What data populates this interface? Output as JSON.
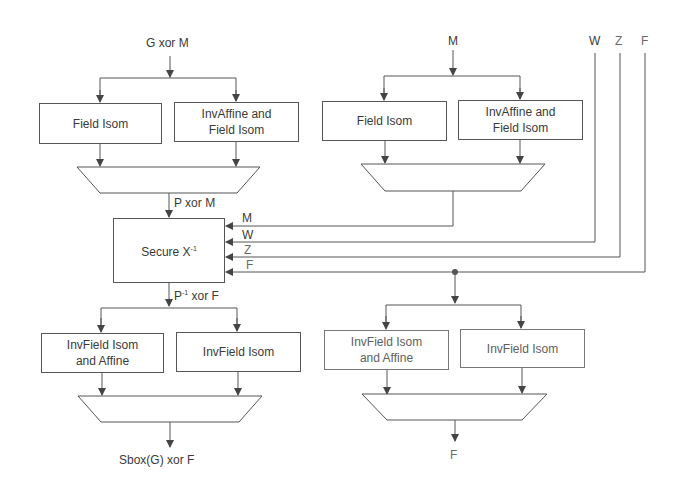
{
  "diagram": {
    "title": "",
    "left_path": {
      "input_label": "G xor M",
      "top_boxes": [
        {
          "label_lines": [
            "Field Isom"
          ]
        },
        {
          "label_lines": [
            "InvAffine and",
            "Field Isom"
          ]
        }
      ],
      "mux_output_label": "P xor M",
      "inverter": {
        "label": "Secure X",
        "superscript": "-1"
      },
      "inverter_inputs": [
        "M",
        "W",
        "Z",
        "F"
      ],
      "inverter_output_label": {
        "text_a": "P",
        "superscript": "-1",
        "text_b": " xor F"
      },
      "bottom_boxes": [
        {
          "label_lines": [
            "InvField Isom",
            "and Affine"
          ]
        },
        {
          "label_lines": [
            "InvField Isom"
          ]
        }
      ],
      "output_label": "Sbox(G) xor F"
    },
    "right_path": {
      "input_label": "M",
      "top_boxes": [
        {
          "label_lines": [
            "Field Isom"
          ]
        },
        {
          "label_lines": [
            "InvAffine and",
            "Field Isom"
          ]
        }
      ],
      "mask_inputs": [
        "W",
        "Z",
        "F"
      ],
      "bottom_boxes": [
        {
          "label_lines": [
            "InvField Isom",
            "and Affine"
          ]
        },
        {
          "label_lines": [
            "InvField Isom"
          ]
        }
      ],
      "output_label": "F"
    },
    "colors": {
      "line": "#555555",
      "text": "#3a3a3a",
      "light_text": "#6a6a6a",
      "background": "#ffffff"
    }
  }
}
